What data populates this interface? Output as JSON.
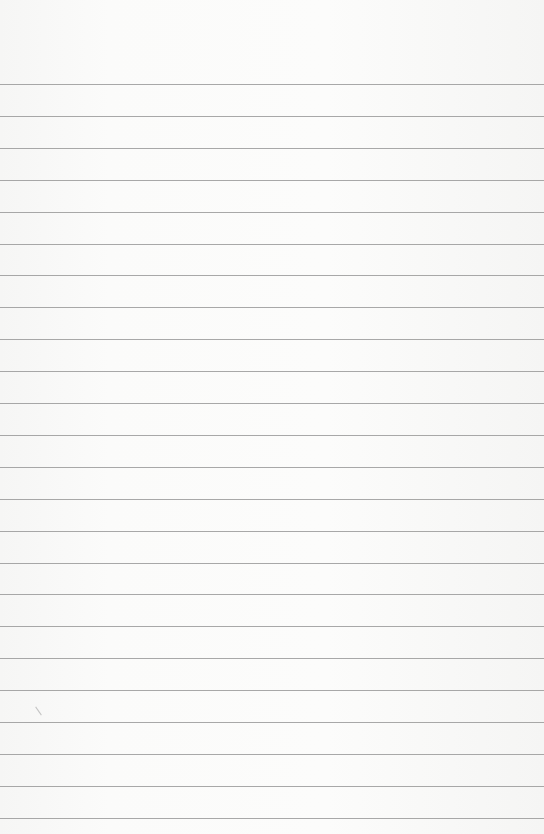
{
  "page": {
    "type": "blank-lined-paper",
    "background_color": "#fafaf9",
    "line_color": "#8c8c8c",
    "line_count": 24,
    "first_line_y": 84,
    "line_spacing": 31.9
  }
}
